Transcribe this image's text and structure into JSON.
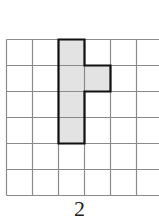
{
  "figure": {
    "grid": {
      "origin_x": 6.5,
      "origin_y": 39.5,
      "cell": 26,
      "cols": 6,
      "rows": 6,
      "line_color": "#8a8a8a",
      "line_width": 1.2
    },
    "shape": {
      "cells": [
        [
          2,
          0
        ],
        [
          2,
          1
        ],
        [
          3,
          1
        ],
        [
          2,
          2
        ],
        [
          2,
          3
        ]
      ],
      "fill": "#e3e3e3",
      "stroke": "#111111",
      "stroke_width": 2.2
    },
    "caption": "2"
  }
}
